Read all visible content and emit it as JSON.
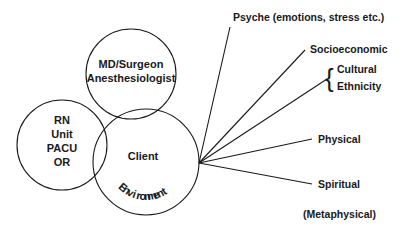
{
  "diagram": {
    "background_color": "#ffffff",
    "stroke_color": "#1a1a1a",
    "text_color": "#1a1a1a",
    "circles": [
      {
        "id": "nursing",
        "name": "rn-unit-circle",
        "cx": 62,
        "cy": 145,
        "r": 45,
        "lines": [
          "RN",
          "Unit",
          "PACU",
          "OR"
        ],
        "label_block": "RN\nUnit\nPACU\nOR"
      },
      {
        "id": "physician",
        "name": "md-surgeon-circle",
        "cx": 131,
        "cy": 74,
        "r": 45,
        "lines": [
          "MD/Surgeon",
          "Anesthesiologist"
        ],
        "label_block": "MD/Surgeon\nAnesthesiologist"
      },
      {
        "id": "client",
        "name": "client-environment-circle",
        "cx": 146,
        "cy": 162,
        "r": 53,
        "lines": [
          "Client"
        ],
        "arc_label": "Environment",
        "label_block": "Client"
      }
    ],
    "circle_texts": {
      "rn_line_1": "RN",
      "rn_line_2": "Unit",
      "rn_line_3": "PACU",
      "rn_line_4": "OR",
      "md_line_1": "MD/Surgeon",
      "md_line_2": "Anesthesiologist",
      "client": "Client",
      "environment": "Environment"
    },
    "convergence_point": {
      "x": 199,
      "y": 163
    },
    "radiating_labels": [
      {
        "id": "psyche",
        "name": "label-psyche",
        "text": "Psyche (emotions, stress etc.)",
        "text_x": 233,
        "text_y": 21,
        "anchor": "start",
        "has_line": true,
        "line_end_x": 230,
        "line_end_y": 27
      },
      {
        "id": "socioeconomic",
        "name": "label-socioeconomic",
        "text": "Socioeconomic",
        "text_x": 310,
        "text_y": 53,
        "anchor": "start",
        "has_line": true,
        "line_end_x": 305,
        "line_end_y": 50
      },
      {
        "id": "cultural",
        "name": "label-cultural",
        "text": "Cultural",
        "text_x": 337,
        "text_y": 73,
        "anchor": "start",
        "has_line": true,
        "line_end_x": 327,
        "line_end_y": 79
      },
      {
        "id": "ethnicity",
        "name": "label-ethnicity",
        "text": "Ethnicity",
        "text_x": 337,
        "text_y": 90,
        "anchor": "start",
        "has_line": false
      },
      {
        "id": "physical",
        "name": "label-physical",
        "text": "Physical",
        "text_x": 318,
        "text_y": 143,
        "anchor": "start",
        "has_line": true,
        "line_end_x": 312,
        "line_end_y": 139
      },
      {
        "id": "spiritual",
        "name": "label-spiritual",
        "text": "Spiritual",
        "text_x": 318,
        "text_y": 188,
        "anchor": "start",
        "has_line": true,
        "line_end_x": 312,
        "line_end_y": 184
      },
      {
        "id": "metaphysical",
        "name": "label-metaphysical",
        "text": "(Metaphysical)",
        "text_x": 303,
        "text_y": 218,
        "anchor": "start",
        "has_line": false
      }
    ],
    "brace": {
      "name": "curly-brace-icon",
      "glyph": "{",
      "x": 325,
      "y": 87,
      "groups": [
        "Cultural",
        "Ethnicity"
      ]
    },
    "environment_arc": {
      "letters": [
        "E",
        "n",
        "v",
        "i",
        "r",
        "o",
        "n",
        "m",
        "e",
        "n",
        "t"
      ],
      "start_angle_deg": 132,
      "end_angle_deg": 58,
      "radius": 38
    }
  }
}
